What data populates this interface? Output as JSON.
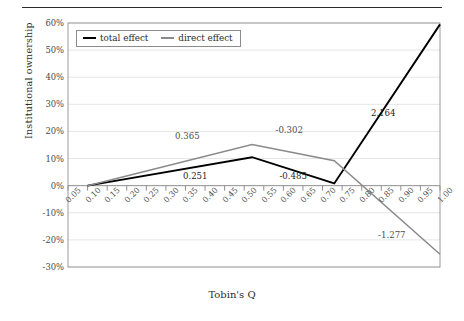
{
  "figure": {
    "has_top_rule": true
  },
  "chart_data": {
    "type": "line",
    "title": "",
    "xlabel": "Tobin's Q",
    "ylabel": "Institutional ownership",
    "xlim": [
      0.05,
      1.0
    ],
    "ylim": [
      -0.3,
      0.6
    ],
    "ytick_labels": [
      "60%",
      "50%",
      "40%",
      "30%",
      "20%",
      "10%",
      "0%",
      "-10%",
      "-20%",
      "-30%"
    ],
    "ytick_values": [
      0.6,
      0.5,
      0.4,
      0.3,
      0.2,
      0.1,
      0.0,
      -0.1,
      -0.2,
      -0.3
    ],
    "xtick_labels": [
      "0.05",
      "0.10",
      "0.15",
      "0.20",
      "0.25",
      "0.30",
      "0.35",
      "0.40",
      "0.45",
      "0.50",
      "0.55",
      "0.60",
      "0.65",
      "0.70",
      "0.75",
      "0.80",
      "0.85",
      "0.90",
      "0.95",
      "1.00"
    ],
    "xtick_values": [
      0.05,
      0.1,
      0.15,
      0.2,
      0.25,
      0.3,
      0.35,
      0.4,
      0.45,
      0.5,
      0.55,
      0.6,
      0.65,
      0.7,
      0.75,
      0.8,
      0.85,
      0.9,
      0.95,
      1.0
    ],
    "grid": true,
    "legend_position": "upper left",
    "series": [
      {
        "name": "total effect",
        "color": "#000000",
        "x": [
          0.1,
          0.52,
          0.73,
          1.0
        ],
        "y": [
          0.0,
          0.105,
          0.008,
          0.595
        ]
      },
      {
        "name": "direct effect",
        "color": "#8a8a8a",
        "x": [
          0.1,
          0.52,
          0.73,
          1.0
        ],
        "y": [
          0.0,
          0.152,
          0.092,
          -0.253
        ]
      }
    ],
    "annotations": [
      {
        "text": "0.365",
        "x": 0.355,
        "y": 0.185,
        "series": "direct effect",
        "color": "gray"
      },
      {
        "text": "0.251",
        "x": 0.375,
        "y": 0.035,
        "series": "total effect",
        "color": "black"
      },
      {
        "text": "-0.302",
        "x": 0.615,
        "y": 0.205,
        "series": "direct effect",
        "color": "gray"
      },
      {
        "text": "-0.485",
        "x": 0.625,
        "y": 0.036,
        "series": "total effect",
        "color": "black"
      },
      {
        "text": "2.164",
        "x": 0.855,
        "y": 0.268,
        "series": "total effect",
        "color": "black"
      },
      {
        "text": "-1.277",
        "x": 0.877,
        "y": -0.183,
        "series": "direct effect",
        "color": "gray"
      }
    ]
  },
  "legend": {
    "items": [
      {
        "label": "total effect",
        "color": "#000000"
      },
      {
        "label": "direct effect",
        "color": "#8a8a8a"
      }
    ]
  }
}
